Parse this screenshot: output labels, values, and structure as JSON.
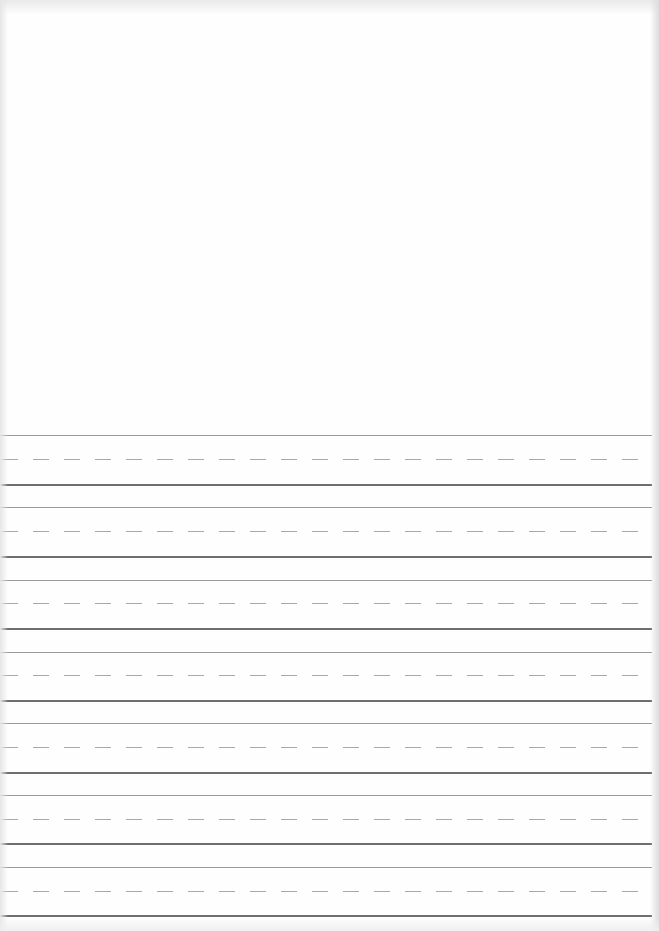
{
  "document": {
    "type": "handwriting practice sheet",
    "blank_area": {
      "top": 0,
      "height": 425
    },
    "line_colors": {
      "top_line": "#9a9a9a",
      "midline_dashed": "#a8a8a8",
      "baseline": "#6e6e6e"
    },
    "dash": {
      "length": 16,
      "period": 31
    },
    "rows": [
      {
        "top": 435,
        "mid": 459,
        "base": 484
      },
      {
        "top": 507,
        "mid": 531,
        "base": 556
      },
      {
        "top": 580,
        "mid": 603,
        "base": 628
      },
      {
        "top": 652,
        "mid": 675,
        "base": 700
      },
      {
        "top": 723,
        "mid": 747,
        "base": 772
      },
      {
        "top": 795,
        "mid": 819,
        "base": 843
      },
      {
        "top": 867,
        "mid": 891,
        "base": 915
      }
    ]
  }
}
